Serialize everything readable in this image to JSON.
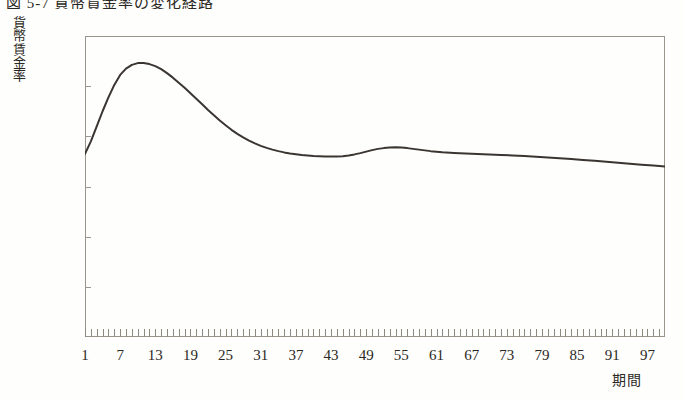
{
  "figure": {
    "title": "図 5-7  貨幣賃金率の変化経路",
    "title_visible_fragment": "図 5-7  貨幣賃金率の変化経路"
  },
  "axes": {
    "y_caption_chars": [
      "貨",
      "幣",
      "賃",
      "金",
      "率"
    ],
    "y_caption": "貨幣賃金率",
    "x_caption": "期間",
    "y_ticks": [
      "12",
      "10",
      "8",
      "6",
      "4",
      "2",
      "0"
    ],
    "x_ticks": [
      "1",
      "7",
      "13",
      "19",
      "25",
      "31",
      "37",
      "43",
      "49",
      "55",
      "61",
      "67",
      "73",
      "79",
      "85",
      "91",
      "97"
    ]
  },
  "colors": {
    "frame": "#9a968e",
    "curve": "#3a3530",
    "text": "#2b2824",
    "background": "#fefefd"
  },
  "chart_data": {
    "type": "line",
    "title": "図 5-7  貨幣賃金率の変化経路",
    "xlabel": "期間",
    "ylabel": "貨幣賃金率",
    "xlim": [
      1,
      100
    ],
    "ylim": [
      0,
      12
    ],
    "ytick_values": [
      0,
      2,
      4,
      6,
      8,
      10,
      12
    ],
    "xtick_values": [
      1,
      7,
      13,
      19,
      25,
      31,
      37,
      43,
      49,
      55,
      61,
      67,
      73,
      79,
      85,
      91,
      97
    ],
    "grid": false,
    "legend": null,
    "minor_tick_count": 100,
    "series": [
      {
        "name": "貨幣賃金率",
        "color": "#3a3530",
        "x": [
          1,
          2,
          3,
          4,
          5,
          6,
          7,
          8,
          9,
          10,
          11,
          12,
          13,
          14,
          15,
          16,
          17,
          18,
          19,
          20,
          21,
          22,
          23,
          24,
          25,
          26,
          27,
          28,
          29,
          30,
          31,
          32,
          33,
          34,
          35,
          36,
          37,
          38,
          39,
          40,
          41,
          42,
          43,
          44,
          45,
          46,
          47,
          48,
          49,
          50,
          51,
          52,
          53,
          54,
          55,
          56,
          57,
          58,
          59,
          60,
          62,
          64,
          66,
          68,
          70,
          72,
          74,
          76,
          78,
          80,
          82,
          84,
          86,
          88,
          90,
          92,
          94,
          96,
          98,
          100
        ],
        "y": [
          7.3,
          7.8,
          8.4,
          9.0,
          9.55,
          10.05,
          10.45,
          10.7,
          10.85,
          10.92,
          10.92,
          10.88,
          10.8,
          10.68,
          10.52,
          10.34,
          10.14,
          9.94,
          9.72,
          9.5,
          9.28,
          9.05,
          8.84,
          8.63,
          8.44,
          8.26,
          8.1,
          7.96,
          7.83,
          7.72,
          7.62,
          7.54,
          7.47,
          7.41,
          7.36,
          7.32,
          7.29,
          7.26,
          7.24,
          7.22,
          7.21,
          7.2,
          7.2,
          7.2,
          7.21,
          7.24,
          7.28,
          7.33,
          7.39,
          7.45,
          7.5,
          7.53,
          7.55,
          7.56,
          7.55,
          7.53,
          7.5,
          7.47,
          7.44,
          7.41,
          7.37,
          7.34,
          7.32,
          7.3,
          7.28,
          7.26,
          7.24,
          7.22,
          7.19,
          7.16,
          7.13,
          7.1,
          7.06,
          7.03,
          6.99,
          6.95,
          6.91,
          6.87,
          6.84,
          6.8
        ]
      }
    ]
  }
}
